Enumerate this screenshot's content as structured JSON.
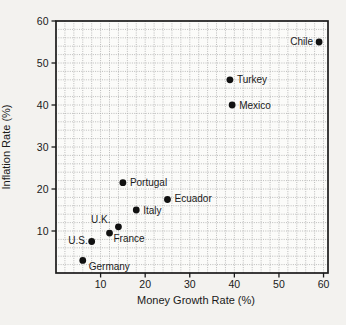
{
  "figure": {
    "background": "#f3f2ef",
    "plot_background": "#fbfbf9"
  },
  "chart_data": {
    "type": "scatter",
    "title": "",
    "xlabel": "Money Growth Rate (%)",
    "ylabel": "Inflation Rate (%)",
    "xlim": [
      0,
      61
    ],
    "ylim": [
      0,
      60
    ],
    "x_ticks": [
      10,
      20,
      30,
      40,
      50,
      60
    ],
    "y_ticks": [
      10,
      20,
      30,
      40,
      50,
      60
    ],
    "minor_grid_step": 2,
    "grid": true,
    "grid_color": "#ababab",
    "frame_color": "#1a1a1a",
    "point_color": "#111111",
    "label_color": "#1a1a1a",
    "points": [
      {
        "name": "Germany",
        "x": 6,
        "y": 3,
        "label_anchor": "start",
        "label_dx": 6,
        "label_dy": 10
      },
      {
        "name": "U.S.",
        "x": 8,
        "y": 7.5,
        "label_anchor": "end",
        "label_dx": -4,
        "label_dy": 2
      },
      {
        "name": "France",
        "x": 12,
        "y": 9.5,
        "label_anchor": "start",
        "label_dx": 4,
        "label_dy": 9
      },
      {
        "name": "U.K.",
        "x": 14,
        "y": 11,
        "label_anchor": "end",
        "label_dx": -8,
        "label_dy": -4
      },
      {
        "name": "Italy",
        "x": 18,
        "y": 15,
        "label_anchor": "start",
        "label_dx": 7,
        "label_dy": 3.5
      },
      {
        "name": "Ecuador",
        "x": 25,
        "y": 17.5,
        "label_anchor": "start",
        "label_dx": 7,
        "label_dy": 2
      },
      {
        "name": "Portugal",
        "x": 15,
        "y": 21.5,
        "label_anchor": "start",
        "label_dx": 7,
        "label_dy": 3
      },
      {
        "name": "Mexico",
        "x": 39.5,
        "y": 40,
        "label_anchor": "start",
        "label_dx": 7,
        "label_dy": 3.5
      },
      {
        "name": "Turkey",
        "x": 39,
        "y": 46,
        "label_anchor": "start",
        "label_dx": 7,
        "label_dy": 3.5
      },
      {
        "name": "Chile",
        "x": 59,
        "y": 55,
        "label_anchor": "end",
        "label_dx": -6,
        "label_dy": 3
      }
    ]
  }
}
